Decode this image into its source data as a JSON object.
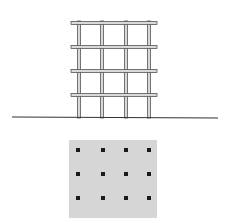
{
  "diagram": {
    "type": "structural-frame-elevation-and-plan",
    "colors": {
      "background": "#ffffff",
      "frame_stroke": "#555555",
      "frame_fill": "#d9d9d9",
      "ground_line": "#333333",
      "plan_fill": "#d6d6d6",
      "column_dot": "#1a1a1a"
    },
    "elevation": {
      "ground_line": {
        "x1": 12,
        "y1": 117,
        "x2": 218,
        "y2": 118
      },
      "columns_x": [
        79,
        102,
        126,
        149
      ],
      "beams_y": [
        23,
        47,
        71,
        95
      ],
      "beam_x_start": 71,
      "beam_x_end": 157,
      "column_top": 21,
      "column_bottom": 118,
      "member_thickness": 3
    },
    "plan": {
      "rect": {
        "x": 69,
        "y": 140,
        "width": 88,
        "height": 78
      },
      "dots_x": [
        78,
        103,
        126,
        149
      ],
      "dots_y": [
        150,
        174,
        198
      ],
      "dot_size": 4
    }
  }
}
